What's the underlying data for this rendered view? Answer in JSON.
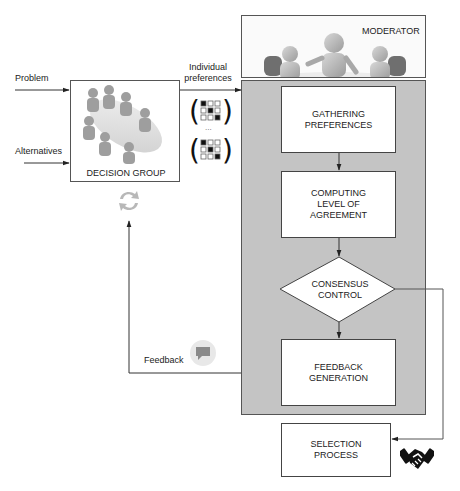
{
  "inputs": {
    "problem": "Problem",
    "alternatives": "Alternatives"
  },
  "decision_group": {
    "label": "DECISION GROUP"
  },
  "individual_preferences": {
    "line1": "Individual",
    "line2": "preferences",
    "ellipsis": "..."
  },
  "moderator": {
    "label": "MODERATOR"
  },
  "steps": {
    "gathering": [
      "GATHERING",
      "PREFERENCES"
    ],
    "computing": [
      "COMPUTING",
      "LEVEL OF",
      "AGREEMENT"
    ],
    "consensus": [
      "CONSENSUS",
      "CONTROL"
    ],
    "feedback_gen": [
      "FEEDBACK",
      "GENERATION"
    ],
    "selection": [
      "SELECTION",
      "PROCESS"
    ]
  },
  "feedback": {
    "label": "Feedback"
  },
  "colors": {
    "panel_gray": "#c4c4c4",
    "line": "#333333",
    "box_border": "#444444",
    "refresh_icon": "#b8b8b8",
    "chat_icon_bg": "#e8e8e8",
    "chat_icon": "#8a8a8a"
  }
}
